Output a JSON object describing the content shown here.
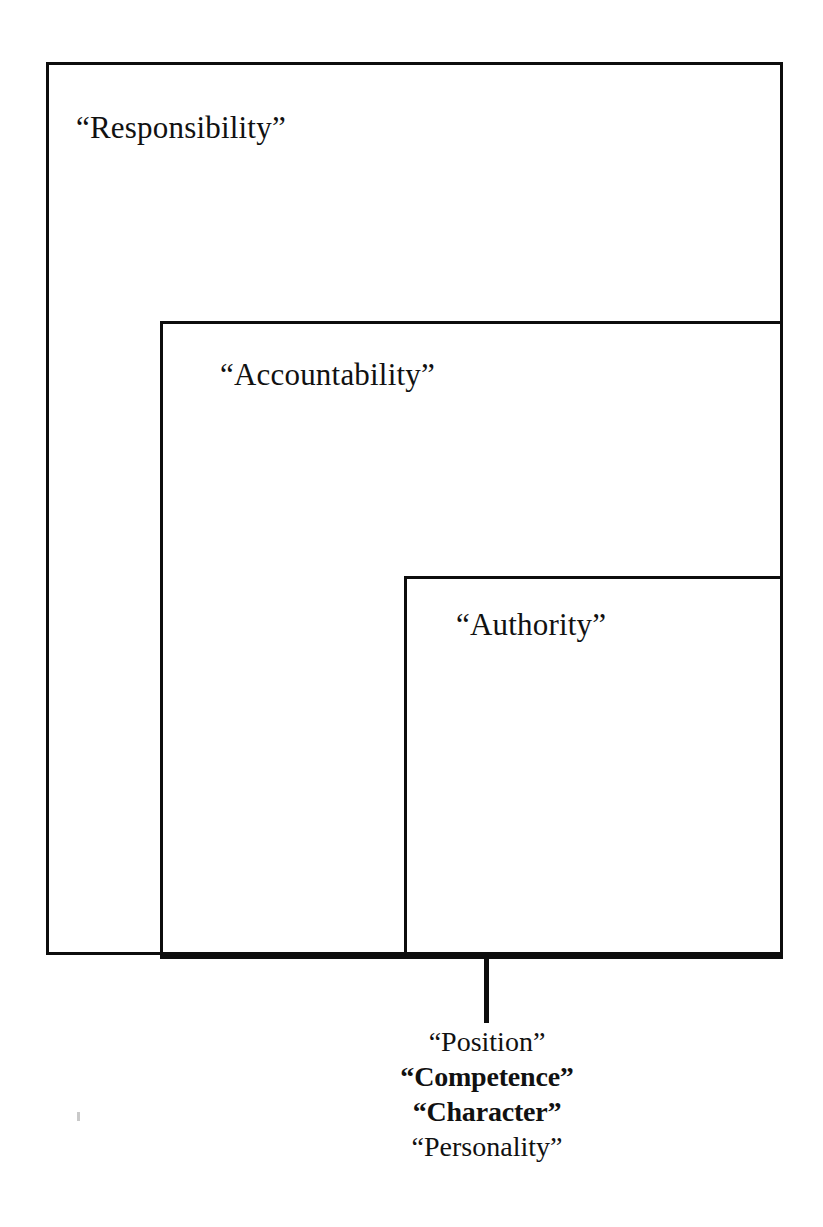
{
  "diagram": {
    "type": "nested-containment-diagram",
    "background_color": "#ffffff",
    "line_color": "#0d0d0d",
    "boxes": [
      {
        "id": "responsibility",
        "label": "“Responsibility”",
        "level": 1,
        "contains": "accountability"
      },
      {
        "id": "accountability",
        "label": "“Accountability”",
        "level": 2,
        "contains": "authority"
      },
      {
        "id": "authority",
        "label": "“Authority”",
        "level": 3,
        "contains": "bases"
      }
    ],
    "leader": {
      "name": "leader-line",
      "from_box": "authority",
      "to_group": "bases"
    },
    "bases": {
      "group_name": "bases-of-authority",
      "items": [
        {
          "label": "“Position”",
          "emphasis": "regular"
        },
        {
          "label": "“Competence”",
          "emphasis": "bold"
        },
        {
          "label": "“Character”",
          "emphasis": "bold"
        },
        {
          "label": "“Personality”",
          "emphasis": "regular"
        }
      ]
    }
  }
}
